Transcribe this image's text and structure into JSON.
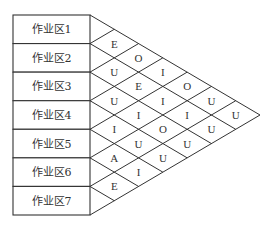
{
  "diagram": {
    "type": "relationship-chart",
    "areas": [
      "作业区1",
      "作业区2",
      "作业区3",
      "作业区4",
      "作业区5",
      "作业区6",
      "作业区7"
    ],
    "relationships": [
      {
        "from": 1,
        "to": 2,
        "code": "E"
      },
      {
        "from": 2,
        "to": 3,
        "code": "U"
      },
      {
        "from": 3,
        "to": 4,
        "code": "U"
      },
      {
        "from": 4,
        "to": 5,
        "code": "I"
      },
      {
        "from": 5,
        "to": 6,
        "code": "A"
      },
      {
        "from": 6,
        "to": 7,
        "code": "E"
      },
      {
        "from": 1,
        "to": 3,
        "code": "O"
      },
      {
        "from": 2,
        "to": 4,
        "code": "E"
      },
      {
        "from": 3,
        "to": 5,
        "code": "I"
      },
      {
        "from": 4,
        "to": 6,
        "code": "U"
      },
      {
        "from": 5,
        "to": 7,
        "code": "I"
      },
      {
        "from": 1,
        "to": 4,
        "code": "I"
      },
      {
        "from": 2,
        "to": 5,
        "code": "I"
      },
      {
        "from": 3,
        "to": 6,
        "code": "O"
      },
      {
        "from": 4,
        "to": 7,
        "code": "U"
      },
      {
        "from": 1,
        "to": 5,
        "code": "O"
      },
      {
        "from": 2,
        "to": 6,
        "code": "I"
      },
      {
        "from": 3,
        "to": 7,
        "code": "U"
      },
      {
        "from": 1,
        "to": 6,
        "code": "U"
      },
      {
        "from": 2,
        "to": 7,
        "code": "U"
      },
      {
        "from": 1,
        "to": 7,
        "code": "U"
      }
    ]
  }
}
